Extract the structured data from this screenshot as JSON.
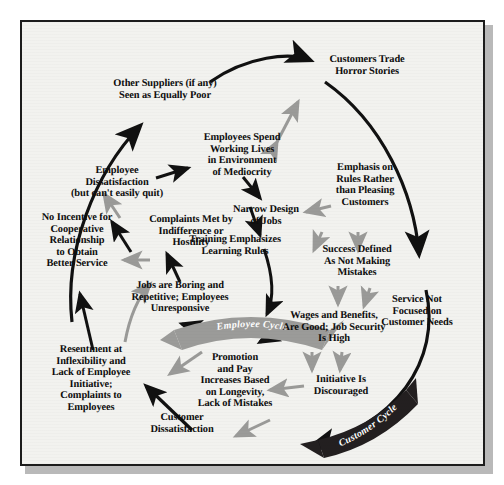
{
  "diagram": {
    "frame": {
      "border_color": "#1c1c1c",
      "background_color": "#f2f2ef"
    },
    "nodes": [
      {
        "id": "other-suppliers",
        "text": "Other Suppliers (if any)\nSeen as Equally Poor"
      },
      {
        "id": "customers-trade",
        "text": "Customers Trade\nHorror Stories"
      },
      {
        "id": "employee-dissatisfaction",
        "text": "Employee\nDissatisfaction\n(but can't easily quit)"
      },
      {
        "id": "employees-spend",
        "text": "Employees Spend\nWorking Lives\nin Environment\nof Mediocrity"
      },
      {
        "id": "emphasis-on-rules",
        "text": "Emphasis on\nRules Rather\nthan Pleasing\nCustomers"
      },
      {
        "id": "narrow-design",
        "text": "Narrow Design\nof Jobs"
      },
      {
        "id": "no-incentive",
        "text": "No Incentive for\nCooperative\nRelationship\nto Obtain\nBetter Service"
      },
      {
        "id": "complaints-met",
        "text": "Complaints Met by\nIndifference or\nHostility"
      },
      {
        "id": "training-emphasizes",
        "text": "Training Emphasizes\nLearning Rules"
      },
      {
        "id": "success-defined",
        "text": "Success Defined\nAs Not Making\nMistakes"
      },
      {
        "id": "service-not-focused",
        "text": "Service Not\nFocused on\nCustomer Needs"
      },
      {
        "id": "jobs-are-boring",
        "text": "Jobs are Boring and\nRepetitive; Employees\nUnresponsive"
      },
      {
        "id": "wages-and-benefits",
        "text": "Wages and Benefits,\nAre Good; Job Security\nIs High"
      },
      {
        "id": "resentment",
        "text": "Resentment at\nInflexibility and\nLack of Employee\nInitiative;\nComplaints to\nEmployees"
      },
      {
        "id": "promotion-and-pay",
        "text": "Promotion\nand Pay\nIncreases Based\non Longevity,\nLack of Mistakes"
      },
      {
        "id": "initiative-discouraged",
        "text": "Initiative Is\nDiscouraged"
      },
      {
        "id": "customer-dissatisfaction",
        "text": "Customer\nDissatisfaction"
      }
    ],
    "banners": [
      {
        "id": "employee-cycle",
        "label": "Employee Cycle",
        "fill": "#9b9b99",
        "text_color": "#ffffff"
      },
      {
        "id": "customer-cycle",
        "label": "Customer Cycle",
        "fill": "#231f20",
        "text_color": "#ffffff"
      }
    ],
    "arrow_colors": {
      "dark": "#111111",
      "light": "#9a9a98"
    }
  }
}
